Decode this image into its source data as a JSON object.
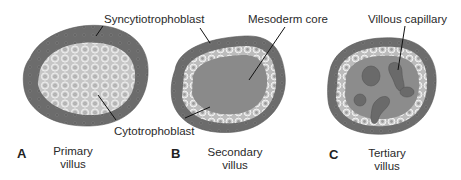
{
  "figure": {
    "labels": {
      "syncytiotrophoblast": "Syncytiotrophoblast",
      "cytotrophoblast": "Cytotrophoblast",
      "mesoderm_core": "Mesoderm core",
      "villous_capillary": "Villous capillary"
    },
    "panels": [
      {
        "letter": "A",
        "caption_line1": "Primary",
        "caption_line2": "villus"
      },
      {
        "letter": "B",
        "caption_line1": "Secondary",
        "caption_line2": "villus"
      },
      {
        "letter": "C",
        "caption_line1": "Tertiary",
        "caption_line2": "villus"
      }
    ],
    "colors": {
      "syncytio": "#6e6e6e",
      "cyto_fill": "#c9c9c9",
      "cell_stroke": "#f2f2f2",
      "mesoderm": "#8a8a8a",
      "capillary": "#666666"
    }
  }
}
